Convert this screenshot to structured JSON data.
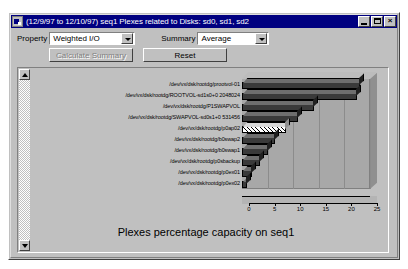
{
  "window": {
    "title": "(12/9/97 to 12/10/97) seq1 Plexes related to Disks: sd0, sd1, sd2",
    "icon": "chart-window-icon",
    "minimize_label": "_",
    "maximize_label": "□",
    "close_label": "×"
  },
  "controls": {
    "property_label": "Property",
    "property_value": "Weighted I/O",
    "summary_label": "Summary",
    "summary_value": "Average",
    "calculate_button": "Calculate Summary",
    "reset_button": "Reset",
    "calculate_disabled": true
  },
  "scrollbar": {
    "up_arrow": "scroll-up-icon",
    "down_arrow": "scroll-down-icon"
  },
  "chart_data": {
    "type": "bar",
    "orientation": "horizontal",
    "title": "Plexes percentage capacity on seq1",
    "xlabel": "",
    "ylabel": "",
    "xlim": [
      0,
      25
    ],
    "xticks": [
      0,
      5,
      10,
      15,
      20,
      25
    ],
    "grid": true,
    "legend": false,
    "categories": [
      "/dev/vx/dsk/rootdg/prootvol-01",
      "/dev/vx/dsk/rootdg/ROOTVOL-sd1s0+0 2048024",
      "/dev/vx/dsk/rootdg/P1SWAPVOL",
      "/dev/vx/dsk/rootdg/SWAPVOL-sd0s1+0 531456",
      "/dev/vx/dsk/rootdg/p0ap02",
      "/dev/vx/dsk/rootdg/b0swap2",
      "/dev/vx/dsk/rootdg/b0swap1",
      "/dev/vx/dsk/rootdg/p0sbackup",
      "/dev/vx/dsk/rootdg/p0ex01",
      "/dev/vx/dsk/rootdg/p0ex02"
    ],
    "values": [
      23.0,
      22.5,
      14.0,
      11.0,
      8.5,
      6.5,
      5.0,
      3.5,
      2.0,
      1.0
    ],
    "highlighted_index": 4,
    "bar_color": "#3a3a3a",
    "highlight_fill": "hatched-white",
    "plot_background": "#a8a8a8"
  }
}
